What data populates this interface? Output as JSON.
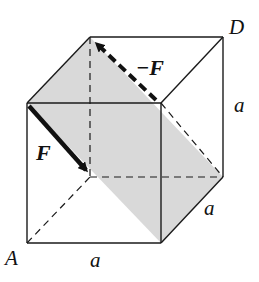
{
  "diagram": {
    "type": "cube-force-couple",
    "colors": {
      "edge": "#1a1a1a",
      "shade": "#d9d9d9",
      "background": "#ffffff"
    },
    "labels": {
      "vertex_a": "A",
      "vertex_d": "D",
      "force": "F",
      "neg_force": "−F",
      "edge_bottom": "a",
      "edge_right": "a",
      "edge_depth": "a"
    }
  }
}
